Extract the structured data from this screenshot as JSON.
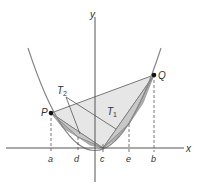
{
  "figure": {
    "axes": {
      "x_label": "x",
      "y_label": "y"
    },
    "points": {
      "P": "P",
      "Q": "Q"
    },
    "regions": {
      "T1": "T",
      "T1_sub": "1",
      "T2": "T",
      "T2_sub": "2"
    },
    "ticks": {
      "a": "a",
      "d": "d",
      "c": "c",
      "e": "e",
      "b": "b"
    },
    "colors": {
      "curve": "#8a8a8a",
      "axis": "#555555",
      "T1_fill": "#e4e4e4",
      "T2_fill": "#c4c4c4",
      "T3_fill": "#a8a8a8",
      "point": "#111111"
    }
  }
}
